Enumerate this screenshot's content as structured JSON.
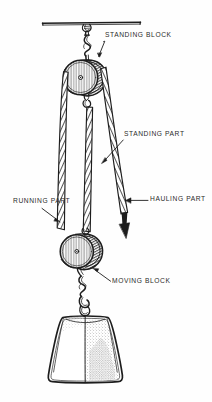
{
  "figure": {
    "background_color": "#fefefe",
    "ink_color": "#1d1d1d",
    "label_color": "#2b2b2b"
  },
  "labels": {
    "standing_block": "STANDING BLOCK",
    "standing_part": "STANDING PART",
    "running_part": "RUNNING PART",
    "hauling_part": "HAULING PART",
    "moving_block": "MOVING BLOCK"
  },
  "components": {
    "overhead_beam": "overhead-support-beam",
    "upper_hook": "standing-block-hook",
    "upper_sheave": "standing-block-sheave",
    "lower_sheave": "moving-block-sheave",
    "lower_hook": "moving-block-hook",
    "load": "suspended-weight",
    "load_eye": "weight-lifting-eye",
    "hauling_arrow": "hauling-direction-arrow"
  }
}
